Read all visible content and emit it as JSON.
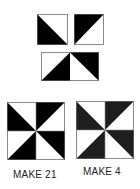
{
  "diagram": {
    "colors": {
      "dark": "#000000",
      "dark_alt": "#1e1e1e",
      "light": "#ffffff",
      "outline": "#8a8a8a"
    },
    "half_square_triangles": [
      {
        "id": "hst-1",
        "dark_corner": "bottom-left"
      },
      {
        "id": "hst-2",
        "dark_corner": "top-left"
      },
      {
        "id": "hst-3",
        "dark_corner": "bottom-right"
      },
      {
        "id": "hst-4",
        "dark_corner": "top-right"
      }
    ],
    "blocks": [
      {
        "id": "block-a",
        "label": "MAKE 21"
      },
      {
        "id": "block-b",
        "label": "MAKE 4"
      }
    ]
  }
}
